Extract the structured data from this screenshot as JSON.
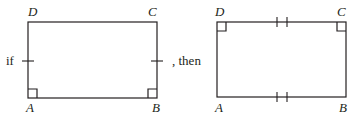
{
  "diagram": {
    "left_figure": {
      "prefix_text": "if",
      "vertices": {
        "A": "A",
        "B": "B",
        "C": "C",
        "D": "D"
      },
      "marks": {
        "right_angles": [
          "A",
          "B"
        ],
        "congruent_sides_single_tick": [
          "AD",
          "BC"
        ]
      }
    },
    "connector_text": ", then",
    "right_figure": {
      "vertices": {
        "A": "A",
        "B": "B",
        "C": "C",
        "D": "D"
      },
      "marks": {
        "right_angles": [
          "D",
          "C"
        ],
        "congruent_sides_double_tick": [
          "DC",
          "AB"
        ]
      }
    },
    "colors": {
      "stroke": "#231f20",
      "background": "#ffffff"
    }
  }
}
